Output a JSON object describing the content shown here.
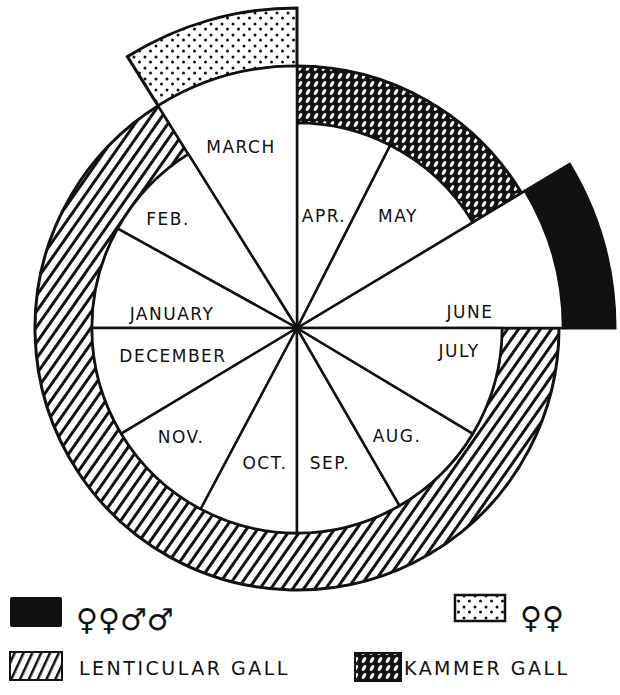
{
  "diagram": {
    "type": "circular-calendar",
    "center": {
      "x": 297,
      "y": 328
    },
    "inner_radius": 205,
    "ring_outer_radius": 262,
    "months": [
      {
        "label": "JUNE",
        "start_deg": 0,
        "end_deg": 31,
        "label_x": 470,
        "label_y": 318
      },
      {
        "label": "MAY",
        "start_deg": 31,
        "end_deg": 63,
        "label_x": 398,
        "label_y": 222
      },
      {
        "label": "APR.",
        "start_deg": 63,
        "end_deg": 90,
        "label_x": 324,
        "label_y": 222
      },
      {
        "label": "MARCH",
        "start_deg": 90,
        "end_deg": 122,
        "label_x": 241,
        "label_y": 153
      },
      {
        "label": "FEB.",
        "start_deg": 122,
        "end_deg": 151,
        "label_x": 168,
        "label_y": 225
      },
      {
        "label": "JANUARY",
        "start_deg": 151,
        "end_deg": 180,
        "label_x": 172,
        "label_y": 320
      },
      {
        "label": "DECEMBER",
        "start_deg": 180,
        "end_deg": 211,
        "label_x": 173,
        "label_y": 362
      },
      {
        "label": "NOV.",
        "start_deg": 211,
        "end_deg": 242,
        "label_x": 181,
        "label_y": 443
      },
      {
        "label": "OCT.",
        "start_deg": 242,
        "end_deg": 270,
        "label_x": 265,
        "label_y": 469
      },
      {
        "label": "SEP.",
        "start_deg": 270,
        "end_deg": 300,
        "label_x": 330,
        "label_y": 469
      },
      {
        "label": "AUG.",
        "start_deg": 300,
        "end_deg": 329,
        "label_x": 397,
        "label_y": 442
      },
      {
        "label": "JULY",
        "start_deg": 329,
        "end_deg": 360,
        "label_x": 459,
        "label_y": 357
      }
    ],
    "bands": [
      {
        "name": "lenticular-gall",
        "start_deg": 122,
        "end_deg": 360,
        "inner_r": 205,
        "outer_r": 262,
        "pattern": "diagonal-hatch"
      },
      {
        "name": "kammer-gall",
        "start_deg": 31,
        "end_deg": 90,
        "inner_r": 205,
        "outer_r": 262,
        "pattern": "cross-hatch"
      },
      {
        "name": "march-female-band",
        "start_deg": 90,
        "end_deg": 122,
        "inner_r": 262,
        "outer_r": 320,
        "pattern": "stipple"
      },
      {
        "name": "june-female-male-band",
        "start_deg": 0,
        "end_deg": 31,
        "inner_r": 266,
        "outer_r": 318,
        "pattern": "solid-black"
      }
    ],
    "extended_wedges": [
      {
        "month": "MARCH",
        "radius": 262
      },
      {
        "month": "JUNE",
        "radius": 266
      }
    ]
  },
  "legend": {
    "solid_black": {
      "swatch": "solid-black",
      "symbols": "♀♀♂♂"
    },
    "stipple": {
      "swatch": "stipple",
      "symbols": "♀♀"
    },
    "lenticular": {
      "swatch": "diagonal-hatch",
      "label": "LENTICULAR GALL"
    },
    "kammer": {
      "swatch": "cross-hatch",
      "label": "KAMMER GALL"
    }
  },
  "colors": {
    "ink": "#111111",
    "paper": "#ffffff"
  }
}
